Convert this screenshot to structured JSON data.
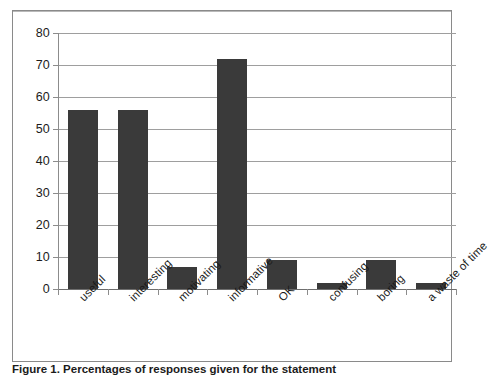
{
  "chart_data": {
    "type": "bar",
    "title": "",
    "xlabel": "",
    "ylabel": "",
    "categories": [
      "useful",
      "interesting",
      "motivating",
      "informative",
      "OK",
      "confusing",
      "boring",
      "a waste of time"
    ],
    "values": [
      56,
      56,
      7,
      72,
      9,
      2,
      9,
      2
    ],
    "ylim": [
      0,
      80
    ],
    "ytick_labels": [
      "80",
      "70",
      "60",
      "50",
      "40",
      "30",
      "20",
      "10",
      "0"
    ],
    "ytick_values": [
      80,
      70,
      60,
      50,
      40,
      30,
      20,
      10,
      0
    ],
    "grid": "horizontal",
    "legend": "none",
    "series": [
      {
        "name": "responses",
        "values": [
          56,
          56,
          7,
          72,
          9,
          2,
          9,
          2
        ]
      }
    ],
    "bar_color": "#3a3a3a",
    "gridline_color": "#9e9e9e",
    "frame_color": "#8a8a8a"
  },
  "caption": {
    "text": "Figure 1. Percentages of responses given for the statement"
  }
}
